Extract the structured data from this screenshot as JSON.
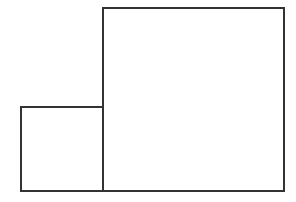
{
  "diagram": {
    "background": "#ffffff",
    "stroke_color": "#333333",
    "stroke_width": 2,
    "shapes": [
      {
        "id": "small-square",
        "type": "rect",
        "x": 21,
        "y": 107,
        "width": 82,
        "height": 84
      },
      {
        "id": "large-square",
        "type": "rect",
        "x": 103,
        "y": 8,
        "width": 181,
        "height": 183
      }
    ]
  }
}
